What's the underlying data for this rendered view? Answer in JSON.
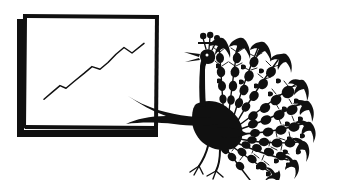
{
  "illustration": {
    "title": "Peacock presenting a rising growth chart",
    "style": "vintage pen-and-ink line art",
    "background_color": "#ffffff",
    "ink_color": "#101010",
    "canvas": {
      "width": 340,
      "height": 180
    }
  },
  "chart_panel": {
    "name": "framed growth chart",
    "frame": {
      "x": 22,
      "y": 14,
      "width": 134,
      "height": 112,
      "border_color": "#101010",
      "has_drop_shadow": true,
      "shadow_offset": 6
    },
    "caption": "",
    "axis_labels": {
      "x": "",
      "y": ""
    }
  },
  "chart_data": {
    "type": "line",
    "title": "",
    "xlabel": "",
    "ylabel": "",
    "grid": false,
    "legend": null,
    "series": [
      {
        "name": "Growth",
        "x": [
          0,
          8,
          16,
          22,
          30,
          40,
          48,
          56,
          64,
          72,
          80,
          88,
          100
        ],
        "values": [
          10,
          20,
          30,
          26,
          36,
          48,
          58,
          54,
          64,
          76,
          86,
          78,
          92
        ]
      }
    ],
    "xlim": [
      0,
      100
    ],
    "ylim": [
      0,
      100
    ],
    "trend": "rising",
    "annotations": []
  },
  "peacock": {
    "name": "peacock",
    "facing": "left",
    "parts": {
      "crest": "three-plume crest",
      "beak": "open pointed beak",
      "neck": "long curved neck",
      "body": "solid black body",
      "wing": "pointed wing extended toward chart",
      "legs": "two thin legs with three-toed feet",
      "tail": "fanned display tail"
    },
    "tail": {
      "feather_count": 11,
      "eyespots_per_feather": 6,
      "tip_shape": "arrowhead"
    }
  }
}
